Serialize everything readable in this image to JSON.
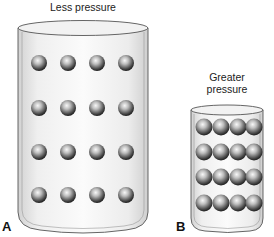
{
  "panels": {
    "a": {
      "letter": "A",
      "label": "Less pressure",
      "rows": 4,
      "cols": 4,
      "particle_count": 16
    },
    "b": {
      "letter": "B",
      "label_line1": "Greater",
      "label_line2": "pressure",
      "rows": 4,
      "cols": 4,
      "particle_count": 16
    }
  },
  "colors": {
    "container_fill": "#e6e6e6",
    "container_stroke": "#555555",
    "particle_dark": "#2a2a2a",
    "particle_light": "#f4f4f4"
  }
}
